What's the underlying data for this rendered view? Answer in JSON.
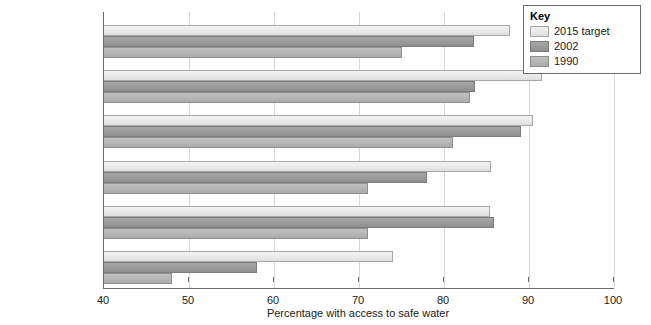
{
  "chart_data": {
    "type": "bar",
    "orientation": "horizontal",
    "title": "",
    "xlabel": "Percentage with access to safe water",
    "ylabel": "",
    "xlim": [
      40,
      100
    ],
    "xticks": [
      40,
      50,
      60,
      70,
      80,
      90,
      100
    ],
    "grid": true,
    "legend_position": "top-right",
    "legend_title": "Key",
    "categories": [
      "World\naverage",
      "Arab\nstates",
      "Latin America\nand the Caribbean",
      "East Asia\nand the Pacific",
      "South\nAsia",
      "Sub-Saharan\nAfrica"
    ],
    "series": [
      {
        "name": "2015 target",
        "color": "#e9e9e9",
        "values": [
          87.8,
          91.5,
          90.5,
          85.5,
          85.4,
          74.0
        ]
      },
      {
        "name": "2002",
        "color": "#9a9a9a",
        "values": [
          83.5,
          83.7,
          89.0,
          78.0,
          85.9,
          58.0
        ]
      },
      {
        "name": "1990",
        "color": "#b5b5b5",
        "values": [
          75.0,
          83.0,
          81.0,
          71.0,
          71.0,
          48.0
        ]
      }
    ]
  }
}
